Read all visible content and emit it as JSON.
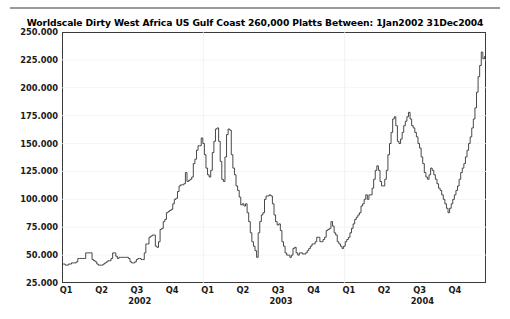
{
  "chart_data": {
    "type": "line",
    "title": "Worldscale Dirty West Africa US Gulf Coast 260,000 Platts Between: 1Jan2002 31Dec2004",
    "xlabel": "",
    "ylabel": "",
    "ylim": [
      25.0,
      250.0
    ],
    "ytick_labels": [
      "250.000",
      "225.000",
      "200.000",
      "175.000",
      "150.000",
      "125.000",
      "100.000",
      "75.000",
      "50.000",
      "25.000"
    ],
    "ytick_values": [
      250.0,
      225.0,
      200.0,
      175.0,
      150.0,
      125.0,
      100.0,
      75.0,
      50.0,
      25.0
    ],
    "xtick_labels": [
      "Q1",
      "Q2",
      "Q3",
      "Q4",
      "Q1",
      "Q2",
      "Q3",
      "Q4",
      "Q1",
      "Q2",
      "Q3",
      "Q4"
    ],
    "year_labels": [
      "2002",
      "2003",
      "2004"
    ],
    "grid": true,
    "legend": false,
    "line_color": "#333333",
    "series_name": "Worldscale rate",
    "x_range_start": "1Jan2002",
    "x_range_end": "31Dec2004",
    "x": [
      0.0,
      0.006,
      0.013,
      0.019,
      0.026,
      0.032,
      0.038,
      0.045,
      0.051,
      0.058,
      0.064,
      0.071,
      0.077,
      0.083,
      0.09,
      0.096,
      0.103,
      0.109,
      0.115,
      0.122,
      0.128,
      0.135,
      0.141,
      0.147,
      0.154,
      0.16,
      0.167,
      0.173,
      0.179,
      0.186,
      0.192,
      0.199,
      0.205,
      0.212,
      0.218,
      0.224,
      0.231,
      0.237,
      0.244,
      0.25,
      0.256,
      0.263,
      0.269,
      0.276,
      0.282,
      0.288,
      0.295,
      0.301,
      0.308,
      0.314,
      0.321,
      0.327,
      0.333,
      0.34,
      0.346,
      0.353,
      0.359,
      0.365,
      0.372,
      0.378,
      0.385,
      0.391,
      0.397,
      0.404,
      0.41,
      0.417,
      0.423,
      0.429,
      0.436,
      0.442,
      0.449,
      0.455,
      0.462,
      0.468,
      0.474,
      0.481,
      0.487,
      0.494,
      0.5,
      0.506,
      0.513,
      0.519,
      0.526,
      0.532,
      0.538,
      0.545,
      0.551,
      0.558,
      0.564,
      0.571,
      0.577,
      0.583,
      0.59,
      0.596,
      0.603,
      0.609,
      0.615,
      0.622,
      0.628,
      0.635,
      0.641,
      0.647,
      0.654,
      0.66,
      0.667,
      0.673,
      0.679,
      0.686,
      0.692,
      0.699,
      0.705,
      0.712,
      0.718,
      0.724,
      0.731,
      0.737,
      0.744,
      0.75,
      0.756,
      0.763,
      0.769,
      0.776,
      0.782,
      0.788,
      0.795,
      0.801,
      0.808,
      0.814,
      0.821,
      0.827,
      0.833,
      0.84,
      0.846,
      0.853,
      0.859,
      0.865,
      0.872,
      0.878,
      0.885,
      0.891,
      0.897,
      0.904,
      0.91,
      0.917,
      0.923,
      0.929,
      0.936,
      0.942,
      0.949,
      0.955,
      0.962,
      0.968,
      0.974,
      0.981,
      0.987,
      0.994,
      1.0
    ],
    "values": [
      42,
      42,
      41,
      41,
      42,
      42,
      43,
      43,
      43,
      44,
      47,
      47,
      47,
      47,
      47,
      52,
      52,
      52,
      52,
      46,
      45,
      44,
      42,
      41,
      41,
      41,
      42,
      43,
      44,
      45,
      45,
      47,
      52,
      52,
      49,
      47,
      48,
      48,
      48,
      48,
      48,
      48,
      47,
      44,
      43,
      43,
      44,
      46,
      47,
      47,
      46,
      46,
      52,
      60,
      60,
      66,
      67,
      68,
      68,
      58,
      57,
      62,
      73,
      74,
      80,
      82,
      88,
      89,
      90,
      91,
      96,
      100,
      101,
      107,
      112,
      113,
      113,
      114,
      124,
      116,
      117,
      118,
      120,
      132,
      136,
      144,
      148,
      148,
      155,
      150,
      140,
      128,
      122,
      120,
      126,
      142,
      152,
      163,
      164,
      152,
      134,
      118,
      116,
      138,
      158,
      163,
      162,
      140,
      128,
      122,
      112,
      108,
      102,
      95,
      96,
      94,
      96,
      88,
      80,
      70,
      62,
      58,
      54,
      48,
      70,
      80,
      86,
      88,
      100,
      103,
      103,
      104,
      103,
      96,
      86,
      80,
      77,
      78,
      72,
      62,
      58,
      52,
      50,
      50,
      48,
      50,
      56,
      57,
      52,
      50,
      52,
      52,
      51,
      51,
      52,
      54,
      56
    ],
    "values_part2": [
      58,
      60,
      60,
      62,
      66,
      66,
      62,
      62,
      64,
      66,
      72,
      73,
      74,
      80,
      76,
      70,
      68,
      62,
      60,
      58,
      56,
      58,
      62,
      64,
      66,
      70,
      74,
      78,
      82,
      84,
      86,
      88,
      94,
      96,
      100,
      104,
      100,
      104,
      104,
      110,
      118,
      126,
      130,
      126,
      116,
      112,
      112,
      118,
      126,
      140,
      150,
      160,
      172,
      174,
      166,
      152,
      150,
      154,
      160,
      166,
      170,
      174,
      178,
      172,
      166,
      164,
      160,
      156,
      150,
      146,
      138,
      132,
      124,
      120,
      118,
      122,
      128,
      126,
      122,
      118,
      114,
      110,
      108,
      104,
      100,
      96,
      92,
      88,
      92,
      96,
      100,
      104,
      108,
      112,
      118,
      124,
      128,
      132,
      138,
      144
    ],
    "note_peak_high": 232,
    "note_peak_q1_2004": 200,
    "note_low": 41
  }
}
